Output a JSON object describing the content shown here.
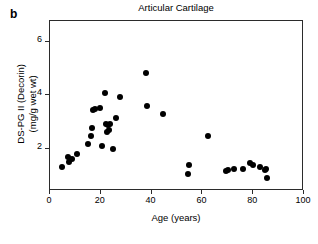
{
  "figure": {
    "panel_letter": "b",
    "title": "Articular Cartilage",
    "xaxis_label": "Age (years)",
    "yaxis_label_line1": "DS-PG II (Decorin)",
    "yaxis_label_line2": "(mg/g wet wt)",
    "marker_color": "#000000",
    "axis_color": "#2b2b2b"
  },
  "chart_data": {
    "type": "scatter",
    "title": "Articular Cartilage",
    "xlabel": "Age (years)",
    "ylabel": "DS-PG II (Decorin) (mg/g wet wt)",
    "xlim": [
      0,
      100
    ],
    "ylim": [
      0.4,
      6.8
    ],
    "xticks": [
      0,
      20,
      40,
      60,
      80,
      100
    ],
    "yticks": [
      2,
      4,
      6
    ],
    "xticklabels": [
      "0",
      "20",
      "40",
      "60",
      "80",
      "100"
    ],
    "yticklabels": [
      "2",
      "4",
      "6"
    ],
    "grid": false,
    "legend": null,
    "series": [
      {
        "name": "Articular cartilage decorin",
        "marker": "filled-circle",
        "color": "#000000",
        "points": [
          [
            5.1,
            1.25
          ],
          [
            7.5,
            1.65
          ],
          [
            8.0,
            1.45
          ],
          [
            9.0,
            1.55
          ],
          [
            11.2,
            1.75
          ],
          [
            15.3,
            2.15
          ],
          [
            16.4,
            2.45
          ],
          [
            17.0,
            2.75
          ],
          [
            17.3,
            3.4
          ],
          [
            18.0,
            3.45
          ],
          [
            20.1,
            3.5
          ],
          [
            21.0,
            2.05
          ],
          [
            22.0,
            4.05
          ],
          [
            22.4,
            2.9
          ],
          [
            23.0,
            2.6
          ],
          [
            23.3,
            2.85
          ],
          [
            23.6,
            2.65
          ],
          [
            24.0,
            2.9
          ],
          [
            25.0,
            1.95
          ],
          [
            26.5,
            3.1
          ],
          [
            27.8,
            3.9
          ],
          [
            38.2,
            4.8
          ],
          [
            38.5,
            3.55
          ],
          [
            44.8,
            3.25
          ],
          [
            54.8,
            1.0
          ],
          [
            55.0,
            1.35
          ],
          [
            62.5,
            2.45
          ],
          [
            69.8,
            1.1
          ],
          [
            70.5,
            1.15
          ],
          [
            72.8,
            1.2
          ],
          [
            76.2,
            1.2
          ],
          [
            79.2,
            1.4
          ],
          [
            80.5,
            1.35
          ],
          [
            83.2,
            1.25
          ],
          [
            85.0,
            1.15
          ],
          [
            85.4,
            1.2
          ],
          [
            85.8,
            0.85
          ]
        ]
      }
    ]
  }
}
